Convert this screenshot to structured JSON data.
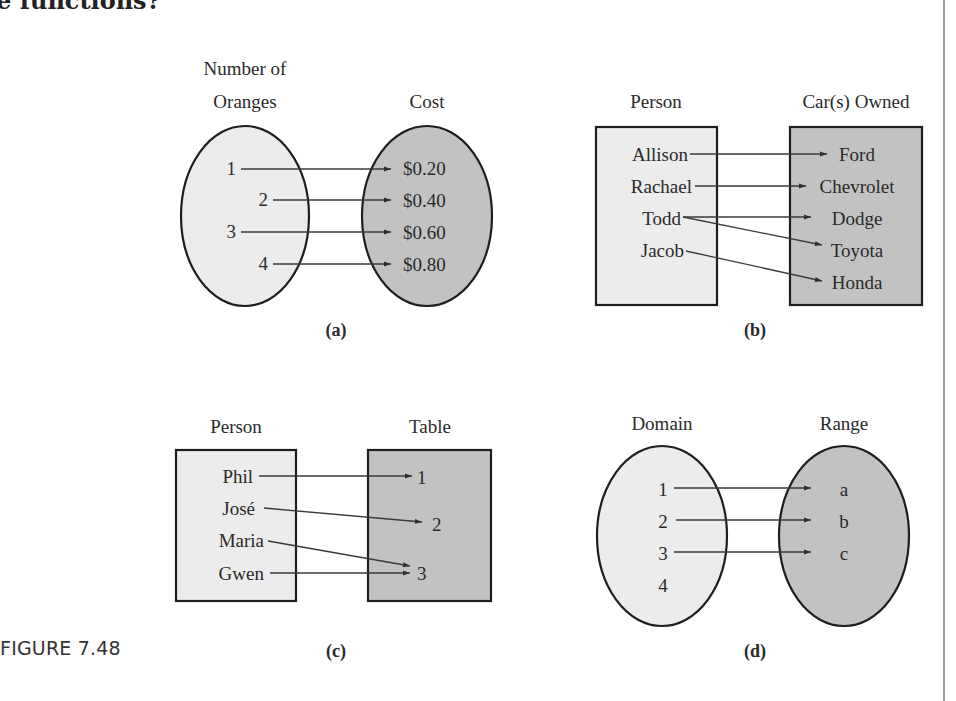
{
  "page": {
    "top_text": "e functions?",
    "figure_caption": "FIGURE 7.48"
  },
  "colors": {
    "light_fill": "#ececec",
    "dark_fill": "#c2c2c2",
    "stroke": "#1e1e1e",
    "arrow": "#3a3a3a",
    "rule": "#9a9a9a"
  },
  "panels": {
    "a": {
      "sublabel": "(a)",
      "left_title_line1": "Number of",
      "left_title_line2": "Oranges",
      "right_title": "Cost",
      "shape": "ellipse",
      "domain": [
        "1",
        "2",
        "3",
        "4"
      ],
      "range": [
        "$0.20",
        "$0.40",
        "$0.60",
        "$0.80"
      ],
      "mappings": [
        [
          "1",
          "$0.20"
        ],
        [
          "2",
          "$0.40"
        ],
        [
          "3",
          "$0.60"
        ],
        [
          "4",
          "$0.80"
        ]
      ]
    },
    "b": {
      "sublabel": "(b)",
      "left_title": "Person",
      "right_title": "Car(s) Owned",
      "shape": "rectangle",
      "domain": [
        "Allison",
        "Rachael",
        "Todd",
        "Jacob"
      ],
      "range": [
        "Ford",
        "Chevrolet",
        "Dodge",
        "Toyota",
        "Honda"
      ],
      "mappings": [
        [
          "Allison",
          "Ford"
        ],
        [
          "Rachael",
          "Chevrolet"
        ],
        [
          "Todd",
          "Dodge"
        ],
        [
          "Todd",
          "Toyota"
        ],
        [
          "Jacob",
          "Honda"
        ]
      ]
    },
    "c": {
      "sublabel": "(c)",
      "left_title": "Person",
      "right_title": "Table",
      "shape": "rectangle",
      "domain": [
        "Phil",
        "José",
        "Maria",
        "Gwen"
      ],
      "range": [
        "1",
        "2",
        "3"
      ],
      "mappings": [
        [
          "Phil",
          "1"
        ],
        [
          "José",
          "2"
        ],
        [
          "Maria",
          "3"
        ],
        [
          "Gwen",
          "3"
        ]
      ]
    },
    "d": {
      "sublabel": "(d)",
      "left_title": "Domain",
      "right_title": "Range",
      "shape": "ellipse",
      "domain": [
        "1",
        "2",
        "3",
        "4"
      ],
      "range": [
        "a",
        "b",
        "c"
      ],
      "mappings": [
        [
          "1",
          "a"
        ],
        [
          "2",
          "b"
        ],
        [
          "3",
          "c"
        ]
      ]
    }
  }
}
